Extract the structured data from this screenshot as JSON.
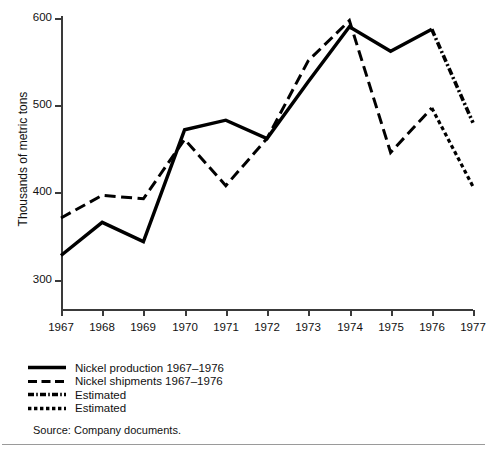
{
  "chart_data": {
    "type": "line",
    "title": "",
    "xlabel": "",
    "ylabel": "Thousands of metric tons",
    "x": [
      1967,
      1968,
      1969,
      1970,
      1971,
      1972,
      1973,
      1974,
      1975,
      1976,
      1977
    ],
    "xticklabels": [
      "1967",
      "1968",
      "1969",
      "1970",
      "1971",
      "1972",
      "1973",
      "1974",
      "1975",
      "1976",
      "1977"
    ],
    "yticks": [
      300,
      400,
      500,
      600
    ],
    "yticklabels": [
      "300",
      "400",
      "500",
      "600"
    ],
    "ylim": [
      270,
      610
    ],
    "xlim": [
      1967,
      1977
    ],
    "grid": false,
    "legend_position": "below-axes-left",
    "series": [
      {
        "name": "Nickel production 1967–1976",
        "style": "solid",
        "x": [
          1967,
          1968,
          1969,
          1970,
          1971,
          1972,
          1973,
          1974,
          1975,
          1976
        ],
        "values": [
          328,
          366,
          344,
          472,
          483,
          462,
          527,
          590,
          562,
          587
        ]
      },
      {
        "name": "Nickel shipments 1967–1976",
        "style": "dashed",
        "x": [
          1967,
          1968,
          1969,
          1970,
          1971,
          1972,
          1973,
          1974,
          1975,
          1976
        ],
        "values": [
          371,
          397,
          393,
          461,
          408,
          462,
          551,
          597,
          446,
          497
        ]
      },
      {
        "name": "Estimated",
        "style": "dash-dot",
        "x": [
          1976,
          1977
        ],
        "values": [
          587,
          480
        ]
      },
      {
        "name": "Estimated",
        "style": "dotted",
        "x": [
          1976,
          1977
        ],
        "values": [
          497,
          407
        ]
      }
    ]
  },
  "legend": {
    "items": [
      {
        "label": "Nickel production 1967–1976",
        "style": "solid"
      },
      {
        "label": "Nickel shipments 1967–1976",
        "style": "dashed"
      },
      {
        "label": "Estimated",
        "style": "dash-dot"
      },
      {
        "label": "Estimated",
        "style": "dotted"
      }
    ]
  },
  "source": {
    "text": "Source: Company documents."
  },
  "colors": {
    "line": "#000000",
    "axis": "#3a3a3a",
    "text": "#111111",
    "rule": "#9a9a9a",
    "background": "#ffffff"
  }
}
